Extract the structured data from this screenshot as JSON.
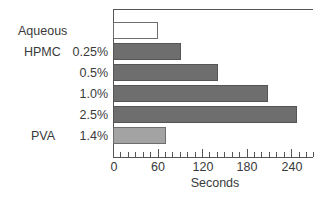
{
  "chart_data": {
    "type": "bar",
    "orientation": "horizontal",
    "title": "",
    "xlabel": "Seconds",
    "ylabel": "",
    "xlim": [
      0,
      270
    ],
    "xticks": [
      0,
      60,
      120,
      180,
      240
    ],
    "minor_tick_step": 10,
    "grid": false,
    "legend": null,
    "categories": [
      {
        "group": "Aqueous",
        "label": "",
        "value": 60,
        "color": "#ffffff",
        "border": "#6e6e6e"
      },
      {
        "group": "HPMC",
        "label": "0.25%",
        "value": 91,
        "color": "#6e6e6e",
        "border": "#555555"
      },
      {
        "group": "",
        "label": "0.5%",
        "value": 141,
        "color": "#6e6e6e",
        "border": "#555555"
      },
      {
        "group": "",
        "label": "1.0%",
        "value": 209,
        "color": "#6e6e6e",
        "border": "#555555"
      },
      {
        "group": "",
        "label": "2.5%",
        "value": 248,
        "color": "#6e6e6e",
        "border": "#555555"
      },
      {
        "group": "PVA",
        "label": "1.4%",
        "value": 71,
        "color": "#a3a3a3",
        "border": "#6e6e6e"
      }
    ]
  },
  "labels": {
    "groups": [
      "Aqueous",
      "HPMC",
      "PVA"
    ],
    "concentrations": [
      "0.25%",
      "0.5%",
      "1.0%",
      "2.5%",
      "1.4%"
    ],
    "xtick_labels": [
      "0",
      "60",
      "120",
      "180",
      "240"
    ],
    "xaxis_title": "Seconds"
  }
}
